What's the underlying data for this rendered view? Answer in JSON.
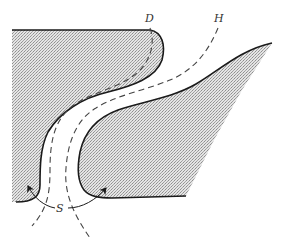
{
  "diagram": {
    "type": "geological-fold-sketch",
    "labels": {
      "d": "D",
      "h": "H",
      "s": "S"
    },
    "colors": {
      "background": "#ffffff",
      "shade_light": "#e2e2e2",
      "shade_dark": "#9a9a9a",
      "outline": "#1a1a1a",
      "dashed": "#444444"
    },
    "regions": [
      {
        "name": "upper-left-block",
        "shaded": true
      },
      {
        "name": "lower-right-block",
        "shaded": true
      },
      {
        "name": "channel",
        "shaded": false
      }
    ],
    "curves": [
      {
        "name": "D",
        "style": "dashed"
      },
      {
        "name": "H",
        "style": "dashed"
      }
    ],
    "arrows": [
      {
        "name": "S-left-arrow",
        "direction": "up-left"
      },
      {
        "name": "S-right-arrow",
        "direction": "up-right"
      }
    ]
  }
}
